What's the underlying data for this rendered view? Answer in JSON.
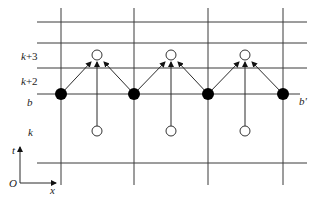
{
  "diagram": {
    "row_labels": {
      "k3_var": "k",
      "k3_suffix": "+3",
      "k2_var": "k",
      "k2_suffix": "+2",
      "b": "b",
      "k": "k"
    },
    "right_label": "b'",
    "axes": {
      "origin": "O",
      "vertical": "t",
      "horizontal": "x"
    },
    "colors": {
      "line": "#3a3a3a",
      "filled_node": "#000000",
      "open_node": "#ffffff"
    },
    "grid": {
      "vertical_x": [
        61,
        134,
        208,
        283
      ],
      "horizontal_y": [
        22,
        43,
        68,
        94,
        163
      ]
    },
    "filled_nodes": [
      {
        "x": 61,
        "y": 94
      },
      {
        "x": 134,
        "y": 94
      },
      {
        "x": 208,
        "y": 94
      },
      {
        "x": 283,
        "y": 94
      }
    ],
    "open_nodes_upper": [
      {
        "x": 97,
        "y": 55
      },
      {
        "x": 171,
        "y": 55
      },
      {
        "x": 245,
        "y": 55
      }
    ],
    "open_nodes_lower": [
      {
        "x": 97,
        "y": 131
      },
      {
        "x": 171,
        "y": 131
      },
      {
        "x": 245,
        "y": 131
      }
    ]
  }
}
